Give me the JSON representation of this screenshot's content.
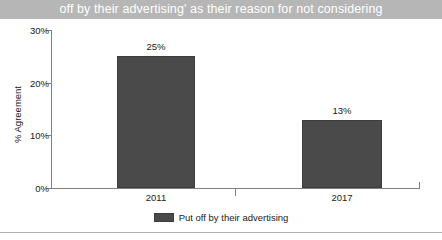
{
  "title": {
    "text": "off by their advertising' as their reason for not considering",
    "band_color": "#b6b6b6",
    "text_color": "#ffffff"
  },
  "colors": {
    "bar": "#4a4a4a",
    "bar_border": "#3d3d3d",
    "axis": "#808080",
    "text": "#1a1a1a",
    "background": "#ffffff",
    "bottom_rule": "#b0b0b0"
  },
  "chart_data": {
    "type": "bar",
    "title": "off by their advertising' as their reason for not considering",
    "categories": [
      "2011",
      "2017"
    ],
    "values": [
      25,
      13
    ],
    "data_labels": [
      "25%",
      "13%"
    ],
    "series": [
      {
        "name": "Put off by their advertising",
        "values": [
          25,
          13
        ]
      }
    ],
    "xlabel": "",
    "ylabel": "% Agreement",
    "ylim": [
      0,
      30
    ],
    "yticks": [
      0,
      10,
      20,
      30
    ],
    "ytick_labels": [
      "0%",
      "10%",
      "20%",
      "30%"
    ],
    "grid": false,
    "legend": {
      "position": "bottom",
      "entries": [
        "Put off by their advertising"
      ]
    }
  }
}
